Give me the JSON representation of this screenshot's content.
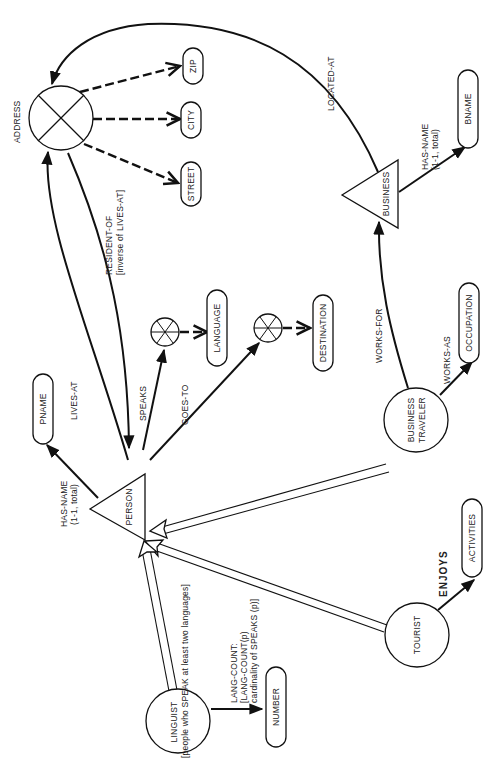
{
  "diagram": {
    "type": "semantic data model",
    "orientation": "rotated 90deg counter-clockwise",
    "classes": {
      "person": "PERSON",
      "business": "BUSINESS",
      "address": "ADDRESS",
      "linguist": "LINGUIST",
      "linguist_sub": "[people who SPEAK at least two languages]",
      "tourist": "TOURIST",
      "business_traveler_1": "BUSINESS",
      "business_traveler_2": "TRAVELER"
    },
    "value_classes": {
      "pname": "PNAME",
      "bname": "BNAME",
      "zip": "ZIP",
      "city": "CITY",
      "street": "STREET",
      "language": "LANGUAGE",
      "destination": "DESTINATION",
      "occupation": "OCCUPATION",
      "activities": "ACTIVITIES",
      "number": "NUMBER"
    },
    "attributes": {
      "person_has_name": "HAS-NAME",
      "person_has_name_card": "(1-1, total)",
      "lives_at": "LIVES-AT",
      "resident_of": "RESIDENT-OF",
      "resident_of_sub": "[inverse of LIVES-AT]",
      "speaks": "SPEAKS",
      "goes_to": "GOES-TO",
      "located_at": "LOCATED-AT",
      "business_has_name": "HAS-NAME",
      "business_has_name_card": "(1-1, total)",
      "works_for": "WORKS-FOR",
      "works_as": "WORKS-AS",
      "enjoys": "ENJOYS",
      "lang_count": "LANG-COUNT:",
      "lang_count_def": "[LANG-COUNT(p)",
      "lang_count_def2": "cardinality of SPEAKS (p)]"
    }
  }
}
